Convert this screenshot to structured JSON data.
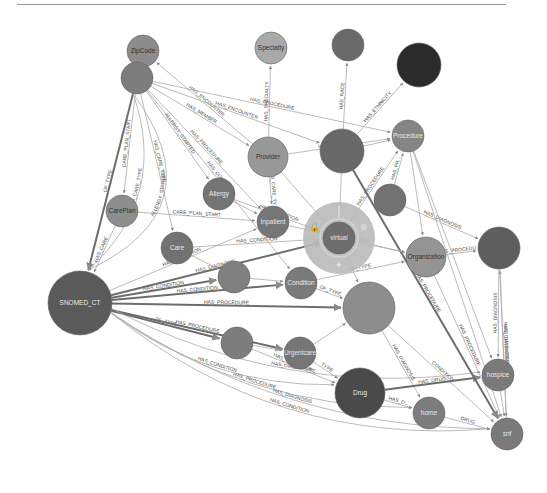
{
  "graph": {
    "nodes": [
      {
        "id": "zipcode",
        "label": "ZipCode",
        "x": 143,
        "y": 51,
        "r": 16,
        "fill": "#8c8c8c",
        "label_dark": true
      },
      {
        "id": "specialty",
        "label": "Specialty",
        "x": 271,
        "y": 48,
        "r": 16,
        "fill": "#a9a9a9",
        "label_dark": true
      },
      {
        "id": "race",
        "label": "",
        "x": 348,
        "y": 45,
        "r": 16,
        "fill": "#6a6a6a"
      },
      {
        "id": "ethnicity",
        "label": "",
        "x": 419,
        "y": 65,
        "r": 22,
        "fill": "#2b2b2b"
      },
      {
        "id": "patient",
        "label": "",
        "x": 137,
        "y": 78,
        "r": 16,
        "fill": "#7d7d7d"
      },
      {
        "id": "provider",
        "label": "Provider",
        "x": 268,
        "y": 157,
        "r": 20,
        "fill": "#989898",
        "label_dark": true
      },
      {
        "id": "encounter",
        "label": "",
        "x": 342,
        "y": 151,
        "r": 22,
        "fill": "#686868"
      },
      {
        "id": "procedure",
        "label": "Procedure",
        "x": 408,
        "y": 136,
        "r": 16,
        "fill": "#858585"
      },
      {
        "id": "allergy",
        "label": "Allergy",
        "x": 219,
        "y": 194,
        "r": 16,
        "fill": "#747474"
      },
      {
        "id": "careplan",
        "label": "CarePlan",
        "x": 122,
        "y": 211,
        "r": 16,
        "fill": "#8e8e8e",
        "label_dark": true
      },
      {
        "id": "inpatient",
        "label": "Inpatient",
        "x": 273,
        "y": 222,
        "r": 16,
        "fill": "#767676"
      },
      {
        "id": "virtual",
        "label": "virtual",
        "x": 339,
        "y": 238,
        "r": 16,
        "fill": "#6e6e6e",
        "halo": true
      },
      {
        "id": "observation",
        "label": "",
        "x": 390,
        "y": 200,
        "r": 16,
        "fill": "#727272"
      },
      {
        "id": "care",
        "label": "Care",
        "x": 177,
        "y": 248,
        "r": 16,
        "fill": "#727272"
      },
      {
        "id": "medication",
        "label": "",
        "x": 234,
        "y": 277,
        "r": 16,
        "fill": "#808080"
      },
      {
        "id": "condition",
        "label": "Condition",
        "x": 301,
        "y": 283,
        "r": 16,
        "fill": "#7a7a7a"
      },
      {
        "id": "organization",
        "label": "Organization",
        "x": 426,
        "y": 257,
        "r": 20,
        "fill": "#949494",
        "label_dark": true
      },
      {
        "id": "payer",
        "label": "",
        "x": 499,
        "y": 248,
        "r": 21,
        "fill": "#5e5e5e"
      },
      {
        "id": "snomed",
        "label": "SNOMED_CT",
        "x": 80,
        "y": 303,
        "r": 32,
        "fill": "#5a5a5a"
      },
      {
        "id": "ambulatory",
        "label": "",
        "x": 369,
        "y": 308,
        "r": 26,
        "fill": "#8d8d8d"
      },
      {
        "id": "wellness",
        "label": "",
        "x": 237,
        "y": 343,
        "r": 16,
        "fill": "#7d7d7d"
      },
      {
        "id": "urgentcare",
        "label": "Urgentcare",
        "x": 300,
        "y": 353,
        "r": 16,
        "fill": "#767676"
      },
      {
        "id": "drug",
        "label": "Drug",
        "x": 360,
        "y": 393,
        "r": 25,
        "fill": "#4a4a4a"
      },
      {
        "id": "hospice",
        "label": "hospice",
        "x": 498,
        "y": 375,
        "r": 16,
        "fill": "#7a7a7a"
      },
      {
        "id": "home",
        "label": "home",
        "x": 429,
        "y": 413,
        "r": 16,
        "fill": "#7d7d7d"
      },
      {
        "id": "snf",
        "label": "snf",
        "x": 507,
        "y": 434,
        "r": 16,
        "fill": "#7a7a7a"
      }
    ],
    "edges": [
      {
        "from": "patient",
        "to": "zipcode",
        "label": "HAS_ZIPCODE"
      },
      {
        "from": "provider",
        "to": "zipcode",
        "label": "HAS_ENCOUNTER"
      },
      {
        "from": "provider",
        "to": "specialty",
        "label": "HAS_SPECIALTY"
      },
      {
        "from": "encounter",
        "to": "race",
        "label": "HAS_RACE"
      },
      {
        "from": "encounter",
        "to": "ethnicity",
        "label": "HAS_ETHNICITY"
      },
      {
        "from": "patient",
        "to": "procedure",
        "label": "HAS_PROCEDURE"
      },
      {
        "from": "patient",
        "to": "provider",
        "label": "HAS_MEMBER"
      },
      {
        "from": "patient",
        "to": "encounter",
        "label": "HAS_ENCOUNTER"
      },
      {
        "from": "patient",
        "to": "careplan",
        "label": "CARE_PLAN_START"
      },
      {
        "from": "patient",
        "to": "snomed",
        "label": "OF_TYPE",
        "thick": true
      },
      {
        "from": "patient",
        "to": "snomed",
        "label": "HAS_CARE_TYPE",
        "curve": -60
      },
      {
        "from": "patient",
        "to": "snomed",
        "label": "ALLERGY_STARTED",
        "curve": -110
      },
      {
        "from": "patient",
        "to": "care",
        "label": "HAS_CARE_TYPE"
      },
      {
        "from": "patient",
        "to": "allergy",
        "label": "ALLERGY_STARTED"
      },
      {
        "from": "patient",
        "to": "inpatient",
        "label": "HAS_PROCEDURE"
      },
      {
        "from": "patient",
        "to": "condition",
        "label": "HAS_CONDITION"
      },
      {
        "from": "careplan",
        "to": "snomed",
        "label": "HAS_CARE..."
      },
      {
        "from": "careplan",
        "to": "inpatient",
        "label": "CARE_PLAN_START"
      },
      {
        "from": "care",
        "to": "virtual",
        "label": "HAS_CONDITION"
      },
      {
        "from": "allergy",
        "to": "virtual",
        "label": "HAS_CONDITION"
      },
      {
        "from": "provider",
        "to": "inpatient",
        "label": "HAS_CARE_TYPE"
      },
      {
        "from": "provider",
        "to": "procedure",
        "label": "HAS_DIAGNOSIS"
      },
      {
        "from": "encounter",
        "to": "procedure",
        "label": ""
      },
      {
        "from": "observation",
        "to": "procedure",
        "label": "HAS_PR..."
      },
      {
        "from": "virtual",
        "to": "procedure",
        "label": "HAS_PROCEDURE"
      },
      {
        "from": "organization",
        "to": "payer",
        "label": "HAS_PROCEDURE"
      },
      {
        "from": "observation",
        "to": "payer",
        "label": "HAS_DIAGNOSIS"
      },
      {
        "from": "snf",
        "to": "payer",
        "label": "HAS_DIAGNOSIS"
      },
      {
        "from": "snomed",
        "to": "medication",
        "label": "HAS_CONDITION",
        "thick": true
      },
      {
        "from": "snomed",
        "to": "condition",
        "label": "HAS_CONDITION",
        "thick": true
      },
      {
        "from": "snomed",
        "to": "ambulatory",
        "label": "HAS_PROCEDURE",
        "thick": true
      },
      {
        "from": "snomed",
        "to": "wellness",
        "label": "OF_TYPE",
        "thick": true
      },
      {
        "from": "snomed",
        "to": "urgentcare",
        "label": "HAS_PROCEDURE",
        "thick": true
      },
      {
        "from": "snomed",
        "to": "virtual",
        "label": "HAS_DIAGNOSIS",
        "thick": true
      },
      {
        "from": "snomed",
        "to": "inpatient",
        "label": "HAS_CONDITION"
      },
      {
        "from": "snomed",
        "to": "drug",
        "label": "HAS_CONDITION",
        "curve": 40
      },
      {
        "from": "snomed",
        "to": "home",
        "label": "HAS_PROCEDURE",
        "curve": 50
      },
      {
        "from": "snomed",
        "to": "hospice",
        "label": "HAS_DIAGNOSIS",
        "curve": 60
      },
      {
        "from": "snomed",
        "to": "snf",
        "label": "HAS_CONDITION",
        "curve": 80
      },
      {
        "from": "snomed",
        "to": "snf",
        "label": "HAS_DIAGNOSIS",
        "curve": 60
      },
      {
        "from": "condition",
        "to": "organization",
        "label": "OF_TYPE"
      },
      {
        "from": "condition",
        "to": "ambulatory",
        "label": "OF_TYPE"
      },
      {
        "from": "ambulatory",
        "to": "snf",
        "label": "CONDITION"
      },
      {
        "from": "ambulatory",
        "to": "home",
        "label": "HAS_DIAGNOSIS"
      },
      {
        "from": "urgentcare",
        "to": "drug",
        "label": "TYPE"
      },
      {
        "from": "drug",
        "to": "hospice",
        "label": "HAS_DRUG",
        "thick": true
      },
      {
        "from": "drug",
        "to": "home",
        "label": "HAS_D..."
      },
      {
        "from": "home",
        "to": "snf",
        "label": "DRUG"
      },
      {
        "from": "hospice",
        "to": "snf",
        "label": ""
      },
      {
        "from": "organization",
        "to": "snf",
        "label": "HAS_PROCEDURE"
      },
      {
        "from": "encounter",
        "to": "snf",
        "label": "HAS_PROCEDURE",
        "thick": true
      },
      {
        "from": "procedure",
        "to": "hospice",
        "label": ""
      },
      {
        "from": "procedure",
        "to": "snf",
        "label": ""
      },
      {
        "from": "payer",
        "to": "hospice",
        "label": "HAS_DIAGNOSIS"
      },
      {
        "from": "virtual",
        "to": "organization",
        "label": ""
      },
      {
        "from": "inpatient",
        "to": "organization",
        "label": "HAS_DIAGNOSIS"
      },
      {
        "from": "medication",
        "to": "condition",
        "label": ""
      },
      {
        "from": "care",
        "to": "medication",
        "label": ""
      },
      {
        "from": "allergy",
        "to": "inpatient",
        "label": ""
      },
      {
        "from": "wellness",
        "to": "urgentcare",
        "label": ""
      },
      {
        "from": "wellness",
        "to": "drug",
        "label": "HAS_PROCEDURE"
      },
      {
        "from": "urgentcare",
        "to": "ambulatory",
        "label": ""
      },
      {
        "from": "virtual",
        "to": "ambulatory",
        "label": ""
      },
      {
        "from": "encounter",
        "to": "virtual",
        "label": ""
      },
      {
        "from": "provider",
        "to": "virtual",
        "label": ""
      },
      {
        "from": "procedure",
        "to": "organization",
        "label": ""
      },
      {
        "from": "payer",
        "to": "snf",
        "label": "HAS_DIAGNOSIS"
      }
    ],
    "halo_icons": [
      "lock-icon",
      "close-icon",
      "expand-icon",
      "scissors-icon"
    ]
  }
}
